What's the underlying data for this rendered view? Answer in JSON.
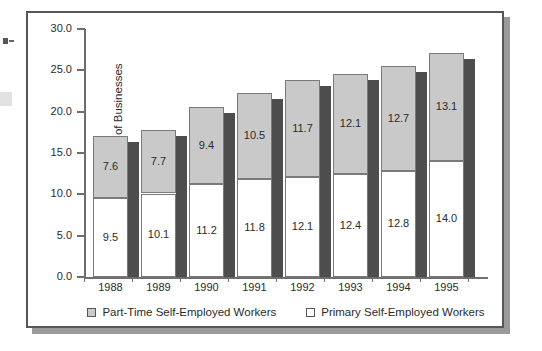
{
  "chart_data": {
    "type": "bar",
    "subtype": "stacked",
    "title": "",
    "xlabel": "",
    "ylabel": "Millions of Businesses",
    "ylim": [
      0.0,
      30.0
    ],
    "ytick_labels": [
      "30.0",
      "25.0",
      "20.0",
      "15.0",
      "10.0",
      "5.0",
      "0.0"
    ],
    "ytick_values": [
      30.0,
      25.0,
      20.0,
      15.0,
      10.0,
      5.0,
      0.0
    ],
    "grid": false,
    "legend_position": "bottom-center",
    "categories": [
      "1988",
      "1989",
      "1990",
      "1991",
      "1992",
      "1993",
      "1994",
      "1995"
    ],
    "series": [
      {
        "name": "Primary Self-Employed Workers",
        "color": "#ffffff",
        "values": [
          9.5,
          10.1,
          11.2,
          11.8,
          12.1,
          12.4,
          12.8,
          14.0
        ],
        "labels": [
          "9.5",
          "10.1",
          "11.2",
          "11.8",
          "12.1",
          "12.4",
          "12.8",
          "14.0"
        ]
      },
      {
        "name": "Part-Time Self-Employed Workers",
        "color": "#c9c9c9",
        "values": [
          7.6,
          7.7,
          9.4,
          10.5,
          11.7,
          12.1,
          12.7,
          13.1
        ],
        "labels": [
          "7.6",
          "7.7",
          "9.4",
          "10.5",
          "11.7",
          "12.1",
          "12.7",
          "13.1"
        ]
      }
    ],
    "totals": [
      17.1,
      17.8,
      20.6,
      22.3,
      23.8,
      24.5,
      25.5,
      27.1
    ]
  },
  "legend": {
    "entries": [
      {
        "label": "Part-Time Self-Employed Workers",
        "swatch": "gray"
      },
      {
        "label": "Primary Self-Employed Workers",
        "swatch": "white"
      }
    ]
  },
  "colors": {
    "bar_gray": "#c9c9c9",
    "bar_white": "#ffffff",
    "bar_shadow": "#4d4d4d",
    "axis": "#6e6e6e",
    "frame": "#575757",
    "frame_shadow": "#9a9a9a",
    "text": "#2b2b2b"
  }
}
